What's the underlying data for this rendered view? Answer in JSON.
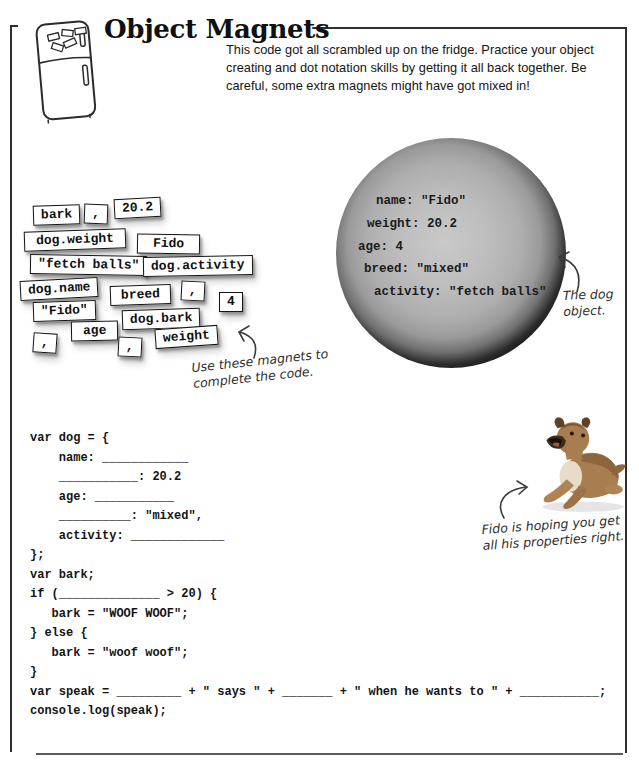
{
  "header": {
    "title": "Object Magnets",
    "intro": "This code got all scrambled up on the fridge. Practice your object creating and dot notation skills by getting it all back together. Be careful, some extra magnets might have got mixed in!"
  },
  "magnets": {
    "caption": [
      "Use these magnets to",
      "complete the code."
    ],
    "items": [
      {
        "label": "bark",
        "x": 33,
        "y": 205,
        "rot": -2,
        "pad": 0
      },
      {
        "label": ",",
        "x": 84,
        "y": 204,
        "rot": 2,
        "pad": 0
      },
      {
        "label": "20.2",
        "x": 114,
        "y": 198,
        "rot": -3,
        "pad": 0
      },
      {
        "label": "dog.weight",
        "x": 24,
        "y": 230,
        "rot": -2,
        "pad": 4
      },
      {
        "label": "Fido",
        "x": 137,
        "y": 234,
        "rot": 1,
        "pad": 8
      },
      {
        "label": "\"fetch balls\"",
        "x": 30,
        "y": 255,
        "rot": 1,
        "pad": 0
      },
      {
        "label": "dog.activity",
        "x": 143,
        "y": 256,
        "rot": -1,
        "pad": 0
      },
      {
        "label": "dog.name",
        "x": 20,
        "y": 279,
        "rot": -3,
        "pad": 0
      },
      {
        "label": "breed",
        "x": 110,
        "y": 285,
        "rot": -2,
        "pad": 3
      },
      {
        "label": ",",
        "x": 181,
        "y": 281,
        "rot": 3,
        "pad": 0
      },
      {
        "label": "4",
        "x": 219,
        "y": 292,
        "rot": 0,
        "pad": 0
      },
      {
        "label": "\"Fido\"",
        "x": 33,
        "y": 301,
        "rot": -2,
        "pad": 0
      },
      {
        "label": "dog.bark",
        "x": 122,
        "y": 309,
        "rot": -2,
        "pad": 0
      },
      {
        "label": "age",
        "x": 71,
        "y": 321,
        "rot": -1,
        "pad": 4
      },
      {
        "label": ",",
        "x": 33,
        "y": 333,
        "rot": 4,
        "pad": 0
      },
      {
        "label": ",",
        "x": 118,
        "y": 337,
        "rot": 3,
        "pad": 0
      },
      {
        "label": "weight",
        "x": 155,
        "y": 327,
        "rot": -4,
        "pad": 0
      }
    ]
  },
  "dog_object": {
    "caption": [
      "The dog",
      "object."
    ],
    "lines": [
      {
        "text": "name: \"Fido\"",
        "x": 40,
        "y": 56
      },
      {
        "text": "weight: 20.2",
        "x": 31,
        "y": 79
      },
      {
        "text": "age: 4",
        "x": 22,
        "y": 102
      },
      {
        "text": "breed: \"mixed\"",
        "x": 28,
        "y": 124
      },
      {
        "text": "activity: \"fetch balls\"",
        "x": 38,
        "y": 147
      }
    ]
  },
  "dog_photo": {
    "caption": [
      "Fido is hoping you get",
      "all his properties right."
    ]
  },
  "code": {
    "lines": [
      "var dog = {",
      "    name: ____________",
      "    ___________: 20.2",
      "    age: ___________",
      "    __________: \"mixed\",",
      "    activity: _____________",
      "};",
      "var bark;",
      "if (______________ > 20) {",
      "   bark = \"WOOF WOOF\";",
      "} else {",
      "   bark = \"woof woof\";",
      "}",
      "var speak = _________ + \" says \" + _______ + \" when he wants to \" + ___________;",
      "console.log(speak);"
    ]
  },
  "colors": {
    "ink": "#141414",
    "annotation": "#2e2e2e",
    "circle_dark_ring": "#151515",
    "circle_inner": "#b5b5b5",
    "dog_tan": "#a87e50"
  }
}
